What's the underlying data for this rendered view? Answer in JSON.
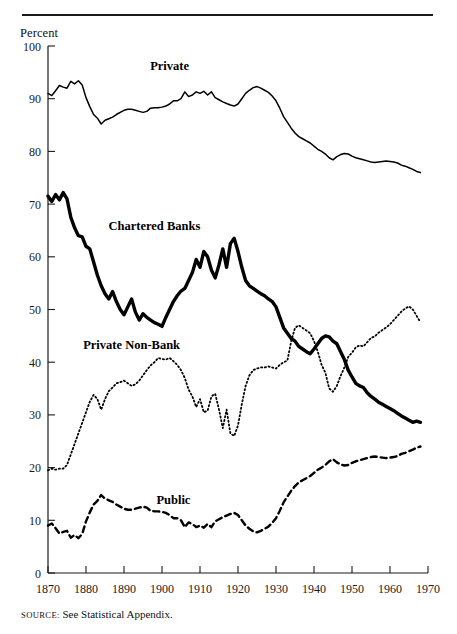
{
  "figure": {
    "y_axis_title": "Percent",
    "source_label": "SOURCE",
    "source_separator": ":",
    "source_text": "See Statistical Appendix."
  },
  "chart_data": {
    "type": "line",
    "title": "",
    "xlabel": "",
    "ylabel": "Percent",
    "xlim": [
      1870,
      1970
    ],
    "ylim": [
      0,
      100
    ],
    "xticks": [
      1870,
      1880,
      1890,
      1900,
      1910,
      1920,
      1930,
      1940,
      1950,
      1960,
      1970
    ],
    "yticks": [
      0,
      10,
      20,
      30,
      40,
      50,
      60,
      70,
      80,
      90,
      100
    ],
    "grid": false,
    "legend": "inline-annotations",
    "annotations": [
      {
        "text": "Private",
        "x": 1902,
        "y": 95.5
      },
      {
        "text": "Chartered Banks",
        "x": 1898,
        "y": 65.0
      },
      {
        "text": "Private Non-Bank",
        "x": 1892,
        "y": 42.5
      },
      {
        "text": "Public",
        "x": 1903,
        "y": 13.0
      }
    ],
    "series": [
      {
        "name": "Private",
        "style": "solid-thin",
        "stroke_width": 1.5,
        "dasharray": "",
        "x": [
          1870,
          1871,
          1872,
          1873,
          1874,
          1875,
          1876,
          1877,
          1878,
          1879,
          1880,
          1881,
          1882,
          1883,
          1884,
          1885,
          1886,
          1887,
          1888,
          1889,
          1890,
          1891,
          1892,
          1893,
          1894,
          1895,
          1896,
          1897,
          1898,
          1899,
          1900,
          1901,
          1902,
          1903,
          1904,
          1905,
          1906,
          1907,
          1908,
          1909,
          1910,
          1911,
          1912,
          1913,
          1914,
          1915,
          1916,
          1917,
          1918,
          1919,
          1920,
          1921,
          1922,
          1923,
          1924,
          1925,
          1926,
          1927,
          1928,
          1929,
          1930,
          1931,
          1932,
          1933,
          1934,
          1935,
          1936,
          1937,
          1938,
          1939,
          1940,
          1941,
          1942,
          1943,
          1944,
          1945,
          1946,
          1947,
          1948,
          1949,
          1950,
          1951,
          1952,
          1953,
          1954,
          1955,
          1956,
          1957,
          1958,
          1959,
          1960,
          1961,
          1962,
          1963,
          1964,
          1965,
          1966,
          1967,
          1968
        ],
        "values": [
          91.0,
          90.6,
          91.5,
          92.5,
          92.2,
          92.0,
          93.3,
          92.8,
          93.4,
          92.6,
          90.2,
          88.5,
          87.0,
          86.3,
          85.2,
          85.9,
          86.2,
          86.5,
          87.0,
          87.4,
          87.8,
          88.0,
          88.0,
          87.8,
          87.6,
          87.4,
          87.6,
          88.2,
          88.3,
          88.3,
          88.4,
          88.6,
          89.0,
          89.6,
          89.6,
          90.0,
          91.3,
          90.4,
          90.7,
          91.3,
          91.0,
          91.4,
          90.7,
          91.3,
          90.2,
          89.8,
          89.4,
          89.1,
          88.8,
          88.6,
          89.0,
          90.0,
          91.0,
          91.6,
          92.1,
          92.3,
          92.0,
          91.6,
          91.2,
          90.5,
          89.6,
          88.2,
          86.6,
          85.5,
          84.4,
          83.5,
          82.8,
          82.4,
          82.0,
          81.6,
          81.0,
          80.4,
          80.0,
          79.5,
          78.8,
          78.4,
          79.0,
          79.4,
          79.6,
          79.5,
          79.1,
          78.8,
          78.6,
          78.4,
          78.2,
          78.0,
          77.9,
          78.0,
          78.1,
          78.2,
          78.1,
          78.0,
          77.8,
          77.4,
          77.2,
          76.9,
          76.6,
          76.2,
          76.0
        ]
      },
      {
        "name": "Chartered Banks",
        "style": "solid-thick",
        "stroke_width": 3.4,
        "dasharray": "",
        "x": [
          1870,
          1871,
          1872,
          1873,
          1874,
          1875,
          1876,
          1877,
          1878,
          1879,
          1880,
          1881,
          1882,
          1883,
          1884,
          1885,
          1886,
          1887,
          1888,
          1889,
          1890,
          1891,
          1892,
          1893,
          1894,
          1895,
          1896,
          1897,
          1898,
          1899,
          1900,
          1901,
          1902,
          1903,
          1904,
          1905,
          1906,
          1907,
          1908,
          1909,
          1910,
          1911,
          1912,
          1913,
          1914,
          1915,
          1916,
          1917,
          1918,
          1919,
          1920,
          1921,
          1922,
          1923,
          1924,
          1925,
          1926,
          1927,
          1928,
          1929,
          1930,
          1931,
          1932,
          1933,
          1934,
          1935,
          1936,
          1937,
          1938,
          1939,
          1940,
          1941,
          1942,
          1943,
          1944,
          1945,
          1946,
          1947,
          1948,
          1949,
          1950,
          1951,
          1952,
          1953,
          1954,
          1955,
          1956,
          1957,
          1958,
          1959,
          1960,
          1961,
          1962,
          1963,
          1964,
          1965,
          1966,
          1967,
          1968
        ],
        "values": [
          71.5,
          70.5,
          71.8,
          70.8,
          72.2,
          71.0,
          67.5,
          65.5,
          64.0,
          63.8,
          62.0,
          61.5,
          59.0,
          56.5,
          54.5,
          53.0,
          52.0,
          53.4,
          51.5,
          50.0,
          49.0,
          50.5,
          52.0,
          49.5,
          48.0,
          49.2,
          48.5,
          48.0,
          47.5,
          47.2,
          46.8,
          48.5,
          50.0,
          51.5,
          52.6,
          53.5,
          54.0,
          55.5,
          57.0,
          59.5,
          58.0,
          61.0,
          60.0,
          57.5,
          56.0,
          58.5,
          61.5,
          58.0,
          62.5,
          63.5,
          61.0,
          58.0,
          55.5,
          54.5,
          54.0,
          53.5,
          53.0,
          52.6,
          52.0,
          51.5,
          50.5,
          48.5,
          46.5,
          45.5,
          44.5,
          44.0,
          43.0,
          42.5,
          42.0,
          41.6,
          42.5,
          43.5,
          44.5,
          45.0,
          44.8,
          44.0,
          43.5,
          42.0,
          40.5,
          38.5,
          37.2,
          36.0,
          35.5,
          35.2,
          34.2,
          33.5,
          33.0,
          32.4,
          32.0,
          31.6,
          31.2,
          30.8,
          30.3,
          29.8,
          29.4,
          29.0,
          28.6,
          28.8,
          28.6
        ]
      },
      {
        "name": "Private Non-Bank",
        "style": "dotted",
        "stroke_width": 1.8,
        "dasharray": "1.2 2.6",
        "x": [
          1870,
          1871,
          1872,
          1873,
          1874,
          1875,
          1876,
          1877,
          1878,
          1879,
          1880,
          1881,
          1882,
          1883,
          1884,
          1885,
          1886,
          1887,
          1888,
          1889,
          1890,
          1891,
          1892,
          1893,
          1894,
          1895,
          1896,
          1897,
          1898,
          1899,
          1900,
          1901,
          1902,
          1903,
          1904,
          1905,
          1906,
          1907,
          1908,
          1909,
          1910,
          1911,
          1912,
          1913,
          1914,
          1915,
          1916,
          1917,
          1918,
          1919,
          1920,
          1921,
          1922,
          1923,
          1924,
          1925,
          1926,
          1927,
          1928,
          1929,
          1930,
          1931,
          1932,
          1933,
          1934,
          1935,
          1936,
          1937,
          1938,
          1939,
          1940,
          1941,
          1942,
          1943,
          1944,
          1945,
          1946,
          1947,
          1948,
          1949,
          1950,
          1951,
          1952,
          1953,
          1954,
          1955,
          1956,
          1957,
          1958,
          1959,
          1960,
          1961,
          1962,
          1963,
          1964,
          1965,
          1966,
          1967,
          1968
        ],
        "values": [
          19.5,
          19.8,
          19.6,
          19.8,
          19.8,
          20.5,
          22.5,
          24.5,
          26.5,
          28.5,
          30.5,
          32.5,
          33.8,
          33.0,
          31.0,
          33.0,
          34.5,
          35.2,
          36.0,
          36.2,
          36.5,
          36.0,
          35.5,
          35.8,
          36.5,
          37.5,
          38.5,
          39.4,
          40.0,
          40.8,
          40.6,
          40.5,
          40.8,
          40.2,
          39.5,
          38.5,
          37.0,
          34.8,
          33.5,
          31.5,
          33.0,
          30.5,
          30.8,
          33.5,
          34.0,
          31.0,
          27.5,
          31.0,
          26.5,
          26.0,
          28.0,
          32.0,
          35.5,
          37.5,
          38.5,
          38.8,
          39.0,
          39.0,
          39.2,
          39.0,
          38.8,
          39.5,
          40.0,
          40.3,
          44.0,
          46.5,
          47.0,
          46.5,
          46.0,
          45.5,
          44.0,
          42.0,
          39.5,
          38.0,
          35.0,
          34.4,
          35.5,
          37.4,
          39.0,
          41.0,
          41.8,
          42.8,
          43.2,
          43.0,
          43.8,
          44.6,
          44.9,
          45.6,
          46.1,
          46.6,
          47.2,
          48.0,
          48.8,
          49.6,
          50.2,
          50.6,
          50.0,
          48.8,
          47.6
        ]
      },
      {
        "name": "Public",
        "style": "dashed",
        "stroke_width": 2.4,
        "dasharray": "6 4",
        "x": [
          1870,
          1871,
          1872,
          1873,
          1874,
          1875,
          1876,
          1877,
          1878,
          1879,
          1880,
          1881,
          1882,
          1883,
          1884,
          1885,
          1886,
          1887,
          1888,
          1889,
          1890,
          1891,
          1892,
          1893,
          1894,
          1895,
          1896,
          1897,
          1898,
          1899,
          1900,
          1901,
          1902,
          1903,
          1904,
          1905,
          1906,
          1907,
          1908,
          1909,
          1910,
          1911,
          1912,
          1913,
          1914,
          1915,
          1916,
          1917,
          1918,
          1919,
          1920,
          1921,
          1922,
          1923,
          1924,
          1925,
          1926,
          1927,
          1928,
          1929,
          1930,
          1931,
          1932,
          1933,
          1934,
          1935,
          1936,
          1937,
          1938,
          1939,
          1940,
          1941,
          1942,
          1943,
          1944,
          1945,
          1946,
          1947,
          1948,
          1949,
          1950,
          1951,
          1952,
          1953,
          1954,
          1955,
          1956,
          1957,
          1958,
          1959,
          1960,
          1961,
          1962,
          1963,
          1964,
          1965,
          1966,
          1967,
          1968
        ],
        "values": [
          9.0,
          9.4,
          8.5,
          7.5,
          7.8,
          8.0,
          6.7,
          7.2,
          6.6,
          7.4,
          9.8,
          11.5,
          13.0,
          13.7,
          14.8,
          14.1,
          13.8,
          13.5,
          13.0,
          12.6,
          12.2,
          12.0,
          12.0,
          12.2,
          12.4,
          12.6,
          12.4,
          11.8,
          11.7,
          11.7,
          11.6,
          11.4,
          11.0,
          10.4,
          10.4,
          10.0,
          8.7,
          9.6,
          9.3,
          8.7,
          9.0,
          8.6,
          9.3,
          8.7,
          9.8,
          10.2,
          10.6,
          10.9,
          11.2,
          11.4,
          11.0,
          10.0,
          9.0,
          8.4,
          7.9,
          7.7,
          8.0,
          8.4,
          8.8,
          9.5,
          10.4,
          11.8,
          13.4,
          14.5,
          15.6,
          16.5,
          17.2,
          17.6,
          18.0,
          18.4,
          19.0,
          19.6,
          20.0,
          20.5,
          21.2,
          21.6,
          21.0,
          20.6,
          20.4,
          20.5,
          20.9,
          21.2,
          21.4,
          21.6,
          21.8,
          22.0,
          22.1,
          22.0,
          21.9,
          21.8,
          21.9,
          22.0,
          22.2,
          22.6,
          22.8,
          23.1,
          23.4,
          23.8,
          24.0
        ]
      }
    ]
  }
}
